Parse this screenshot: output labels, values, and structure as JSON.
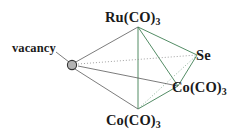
{
  "figure": {
    "background_color": "#ffffff",
    "width": 237,
    "height": 140
  },
  "colors": {
    "bond_green": "#3f7f54",
    "bond_gray": "#5a5a5a",
    "dotted_gray": "#8a8a8a",
    "vertex_fill": "#b3b3b3",
    "vertex_stroke": "#333333",
    "text": "#1a1a1a"
  },
  "labels": {
    "ruthenium": {
      "text": "Ru(CO)",
      "sub": "3"
    },
    "selenium": {
      "text": "Se",
      "sub": ""
    },
    "cobalt_right": {
      "text": "Co(CO)",
      "sub": "3"
    },
    "cobalt_bottom": {
      "text": "Co(CO)",
      "sub": "3"
    },
    "vacancy": {
      "text": "vacancy",
      "sub": ""
    }
  },
  "vertices": [
    {
      "id": "ru",
      "label": "Ru(CO)3",
      "x": 138,
      "y": 27
    },
    {
      "id": "se",
      "label": "Se",
      "x": 197,
      "y": 55
    },
    {
      "id": "co_right",
      "label": "Co(CO)3",
      "x": 178,
      "y": 86
    },
    {
      "id": "co_bottom",
      "label": "Co(CO)3",
      "x": 138,
      "y": 109
    },
    {
      "id": "vacancy",
      "label": "vacancy",
      "x": 72,
      "y": 65
    }
  ],
  "bonds": [
    {
      "from": "ru",
      "to": "se",
      "style": "solid",
      "color": "green"
    },
    {
      "from": "ru",
      "to": "co_right",
      "style": "solid",
      "color": "green"
    },
    {
      "from": "ru",
      "to": "co_bottom",
      "style": "solid",
      "color": "green"
    },
    {
      "from": "se",
      "to": "co_right",
      "style": "solid",
      "color": "green"
    },
    {
      "from": "se",
      "to": "co_bottom",
      "style": "dotted",
      "color": "gray"
    },
    {
      "from": "co_right",
      "to": "co_bottom",
      "style": "solid",
      "color": "green"
    },
    {
      "from": "vacancy",
      "to": "ru",
      "style": "solid",
      "color": "gray"
    },
    {
      "from": "vacancy",
      "to": "se",
      "style": "dotted",
      "color": "gray"
    },
    {
      "from": "vacancy",
      "to": "co_right",
      "style": "solid",
      "color": "gray"
    },
    {
      "from": "vacancy",
      "to": "co_bottom",
      "style": "solid",
      "color": "gray"
    }
  ]
}
